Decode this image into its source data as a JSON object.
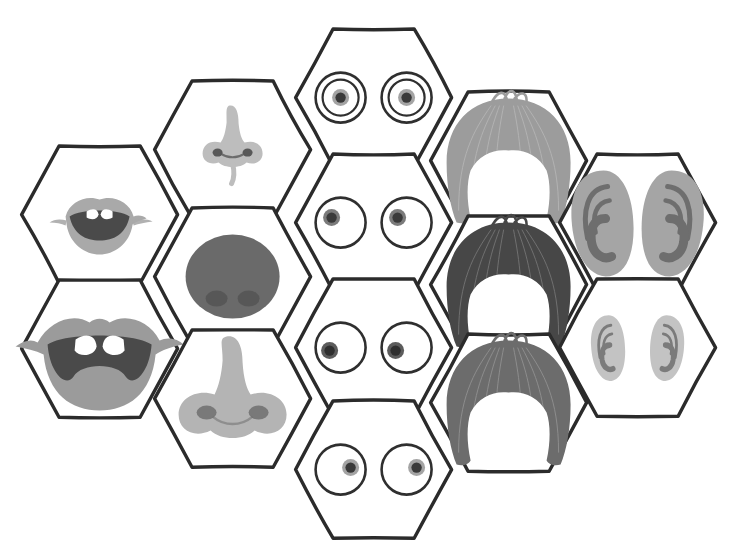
{
  "canvas": {
    "width": 734,
    "height": 549,
    "background": "#ffffff",
    "title": "Face parts hexagon tile set"
  },
  "style": {
    "outline_color": "#2b2b2b",
    "outline_width": 3.4,
    "tile_fill": "#ffffff",
    "ink_dark": "#3a3a3a",
    "ink_mid": "#6f6f6f",
    "ink_light": "#a8a8a8",
    "ink_pale": "#c9c9c9",
    "hex_radius": 78,
    "column_step_x": 117,
    "row_step_y": 124
  },
  "palette": {
    "mouth_lip_light": "#a9a9a9",
    "mouth_lip_mid": "#9b9b9b",
    "mouth_inner_dark": "#4a4a4a",
    "mouth_teeth": "#ffffff",
    "nose_pale": "#bdbdbd",
    "nose_light": "#b4b4b4",
    "nose_dark": "#6a6a6a",
    "nostril_dark": "#585858",
    "eye_white": "#ffffff",
    "eye_outline": "#2f2f2f",
    "iris_mid": "#9a9a9a",
    "pupil_dark": "#3a3a3a",
    "hair_light": "#9c9c9c",
    "hair_dark": "#474747",
    "hair_mid": "#6c6c6c",
    "ear_outer_gray": "#a5a5a5",
    "ear_outer_pale": "#c3c3c3",
    "ear_inner_dark": "#6e6e6e"
  },
  "legend": {
    "columns": [
      {
        "name": "mouths",
        "label": "Mouths",
        "count": 2
      },
      {
        "name": "noses",
        "label": "Noses",
        "count": 3
      },
      {
        "name": "eyes",
        "label": "Eyes",
        "count": 4
      },
      {
        "name": "hair",
        "label": "Hair",
        "count": 3
      },
      {
        "name": "ears",
        "label": "Ears",
        "count": 2
      }
    ],
    "total_tiles": 14
  },
  "tiles": [
    {
      "id": "mouth-closed-teeth",
      "category": "mouth",
      "label": "Small mouth with teeth",
      "cx": 100,
      "cy": 215,
      "r": 78,
      "feature": "mouth-small",
      "lip_color": "#a9a9a9",
      "inner_color": "#4a4a4a",
      "teeth_color": "#ffffff"
    },
    {
      "id": "mouth-open-shout",
      "category": "mouth",
      "label": "Wide open mouth with teeth",
      "cx": 100,
      "cy": 349,
      "r": 78,
      "feature": "mouth-wide",
      "lip_color": "#9b9b9b",
      "inner_color": "#4a4a4a",
      "teeth_color": "#ffffff"
    },
    {
      "id": "nose-small-pale",
      "category": "nose",
      "label": "Small narrow nose",
      "cx": 233,
      "cy": 150,
      "r": 78,
      "feature": "nose-small",
      "fill": "#bdbdbd",
      "nostril": "#585858"
    },
    {
      "id": "nose-round-dark",
      "category": "nose",
      "label": "Round dark button nose",
      "cx": 233,
      "cy": 277,
      "r": 78,
      "feature": "nose-round",
      "fill": "#6a6a6a",
      "nostril": "#525252"
    },
    {
      "id": "nose-large-light",
      "category": "nose",
      "label": "Large broad nose",
      "cx": 233,
      "cy": 399,
      "r": 78,
      "feature": "nose-large",
      "fill": "#b4b4b4",
      "nostril": "#6f6f6f"
    },
    {
      "id": "eyes-center",
      "category": "eyes",
      "label": "Eyes looking straight ahead",
      "cx": 374,
      "cy": 98,
      "r": 78,
      "feature": "eyes",
      "eye_style": "ringed",
      "gaze": "center",
      "pupil_dx": 0,
      "pupil_dy": 0,
      "iris_color": "#9a9a9a",
      "pupil_color": "#3a3a3a"
    },
    {
      "id": "eyes-up-left",
      "category": "eyes",
      "label": "Eyes looking up-left",
      "cx": 374,
      "cy": 223,
      "r": 78,
      "feature": "eyes",
      "eye_style": "plain",
      "gaze": "up-left",
      "pupil_dx": -9,
      "pupil_dy": -5,
      "iris_color": "#6d6d6d",
      "pupil_color": "#3a3a3a"
    },
    {
      "id": "eyes-left",
      "category": "eyes",
      "label": "Eyes looking left",
      "cx": 374,
      "cy": 348,
      "r": 78,
      "feature": "eyes",
      "eye_style": "plain",
      "gaze": "left",
      "pupil_dx": -11,
      "pupil_dy": 3,
      "iris_color": "#4a4a4a",
      "pupil_color": "#2f2f2f"
    },
    {
      "id": "eyes-right",
      "category": "eyes",
      "label": "Eyes looking right",
      "cx": 374,
      "cy": 470,
      "r": 78,
      "feature": "eyes",
      "eye_style": "plain",
      "gaze": "right",
      "pupil_dx": 10,
      "pupil_dy": -2,
      "iris_color": "#9a9a9a",
      "pupil_color": "#3a3a3a"
    },
    {
      "id": "hair-light-bob",
      "category": "hair",
      "label": "Light grey bob hairstyle",
      "cx": 509,
      "cy": 161,
      "r": 78,
      "feature": "hair",
      "fill": "#9c9c9c"
    },
    {
      "id": "hair-dark-bob",
      "category": "hair",
      "label": "Dark bob hairstyle",
      "cx": 509,
      "cy": 285,
      "r": 78,
      "feature": "hair",
      "fill": "#474747"
    },
    {
      "id": "hair-mid-bob",
      "category": "hair",
      "label": "Medium grey bob hairstyle",
      "cx": 509,
      "cy": 403,
      "r": 78,
      "feature": "hair",
      "fill": "#6c6c6c"
    },
    {
      "id": "ears-large",
      "category": "ears",
      "label": "Large ears",
      "cx": 638,
      "cy": 223,
      "r": 78,
      "feature": "ears",
      "size": "large",
      "outer": "#a5a5a5",
      "inner": "#6e6e6e"
    },
    {
      "id": "ears-small",
      "category": "ears",
      "label": "Small ears",
      "cx": 638,
      "cy": 348,
      "r": 78,
      "feature": "ears",
      "size": "small",
      "outer": "#c3c3c3",
      "inner": "#7b7b7b"
    }
  ]
}
